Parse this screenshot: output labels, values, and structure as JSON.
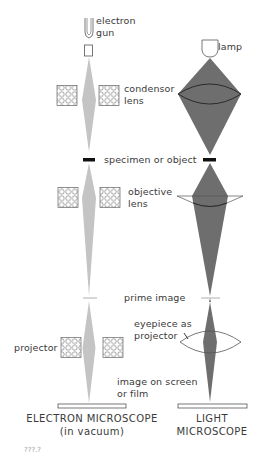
{
  "diagram": {
    "colors": {
      "electron_beam": "#c4c4c4",
      "light_beam": "#6e6e6e",
      "outline": "#555555",
      "text": "#3a3a3a"
    },
    "electron_column": {
      "labels": {
        "source": "electron gun",
        "source_line1": "electron",
        "source_line2": "gun",
        "condenser_line1": "condensor",
        "condenser_line2": "lens",
        "objective_line1": "objective",
        "objective_line2": "lens",
        "projector": "projector",
        "screen_line1": "image on screen",
        "screen_line2": "or film"
      },
      "caption_line1": "ELECTRON MICROSCOPE",
      "caption_line2": "(in vacuum)",
      "lens_type": "electromagnetic coil"
    },
    "light_column": {
      "labels": {
        "source": "lamp",
        "eyepiece_line1": "eyepiece as",
        "eyepiece_line2": "projector"
      },
      "caption_line1": "LIGHT",
      "caption_line2": "MICROSCOPE",
      "lens_type": "glass lens"
    },
    "shared_labels": {
      "specimen": "specimen or object",
      "prime_image": "prime image"
    },
    "footer": "???.?"
  }
}
